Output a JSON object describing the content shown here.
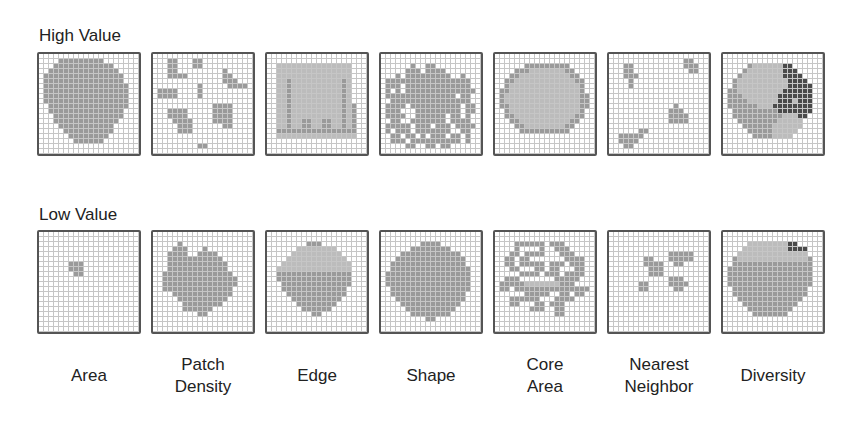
{
  "high_row": {
    "title": "High Value",
    "grids": [
      {
        "name": "area",
        "rows": [
          "00000000000000000000",
          "00001111111110000000",
          "00011111111111100000",
          "00111111111111110000",
          "01111111111111111000",
          "01111111111111111000",
          "01111111111111111100",
          "01111111111111111100",
          "01111111111111111100",
          "01111111111111111100",
          "00111111111111111100",
          "00111111111111111000",
          "00011111111111111000",
          "00011111111111110000",
          "00001111111111100000",
          "00000111111111100000",
          "00000011111111000000",
          "00000001111110000000",
          "00000000000000000000",
          "00000000000000000000"
        ]
      },
      {
        "name": "patch-density",
        "rows": [
          "00000000000000000000",
          "00011000110000000000",
          "00011000110000000000",
          "00011000000000100000",
          "00011110000000110000",
          "00000000000000111000",
          "00000000010000011110",
          "01111000010000000000",
          "01111000010000000000",
          "00000000000000000000",
          "00000000000011110000",
          "00011110000011110000",
          "00011110000011110000",
          "00001111000011110000",
          "00000111000000110000",
          "00000111000000000000",
          "00000000000000000000",
          "00000000000000000000",
          "00000000011000000000",
          "00000000000000000000"
        ]
      },
      {
        "name": "edge",
        "rows": [
          "00000000000000000000",
          "00000000000000000000",
          "00222222222222222000",
          "00222222222222222000",
          "00222222222222222000",
          "00221222222222212000",
          "00221222222222212000",
          "00221222222222212000",
          "00221222222222212000",
          "00221222222222212000",
          "00221222222222212100",
          "00221222222222212100",
          "00221222222222212100",
          "00221221122112212100",
          "00221221122112212100",
          "00111111111111111100",
          "00222222222222222200",
          "00000000000000000000",
          "00000000000000000000",
          "00000000000000000000"
        ]
      },
      {
        "name": "shape",
        "rows": [
          "00000000000000000000",
          "00000000000000000000",
          "00000010011000000000",
          "00000111011110000000",
          "00010111111111001000",
          "01111111111111111100",
          "01110111111111111100",
          "01010111111111111110",
          "01111111111111101100",
          "00111111111111111100",
          "01111011111111110110",
          "01110001111111110110",
          "01111001111110110100",
          "00110011111110111100",
          "01111101110111011110",
          "01011101111111001100",
          "00110110101110110100",
          "00111011111111110100",
          "00000110011011000000",
          "00000000000000000000"
        ]
      },
      {
        "name": "core-area",
        "rows": [
          "00000000000000000000",
          "00000000000000000000",
          "00000011111111100000",
          "00001112222222110000",
          "00011222222222211000",
          "00112222222222221100",
          "00122222222222222100",
          "01122222222222222100",
          "01222222222222222110",
          "01222222222222222110",
          "01122222222222222110",
          "00122222222222222100",
          "00112222222222221100",
          "00011222222222211000",
          "00001122222222110000",
          "00000111111111100000",
          "00000000000000000000",
          "00000000000000000000",
          "00000000000000000000",
          "00000000000000000000"
        ]
      },
      {
        "name": "nearest-neighbor",
        "rows": [
          "00000000000000000000",
          "00000000000000011000",
          "00011000000000011100",
          "00011000000000001100",
          "00011100000000000000",
          "00001000000000000000",
          "00001000000000000000",
          "00000000000000000000",
          "00000000000000000000",
          "00000000000000000000",
          "00000000000001000000",
          "00000000000011100000",
          "00000000000011110000",
          "00000000000011110000",
          "00000000000000000000",
          "00000011000000000000",
          "00111110000000000000",
          "00111100000000000000",
          "00011000000000000000",
          "00000000000000000000"
        ]
      },
      {
        "name": "diversity",
        "rows": [
          "00000000000000000000",
          "00000000000000000000",
          "00000122222233000000",
          "00001222222233300000",
          "00012222222233330000",
          "00122222222223333000",
          "00122222222223333300",
          "01122222222233333300",
          "01112222222333333300",
          "01111222222333233300",
          "01111112223333333300",
          "00111111111333333300",
          "00111111111122233000",
          "00011111111222220000",
          "00001111112222220000",
          "00000111112222200000",
          "00000011112222000000",
          "00000000000000000000",
          "00000000000000000000",
          "00000000000000000000"
        ]
      }
    ]
  },
  "low_row": {
    "title": "Low Value",
    "grids": [
      {
        "name": "area",
        "rows": [
          "00000000000000000000",
          "00000000000000000000",
          "00000000000000000000",
          "00000000000000000000",
          "00000000000000000000",
          "00000000000000000000",
          "00000011100000000000",
          "00000011100000000000",
          "00000001100000000000",
          "00000000000000000000",
          "00000000000000000000",
          "00000000000000000000",
          "00000000000000000000",
          "00000000000000000000",
          "00000000000000000000",
          "00000000000000000000",
          "00000000000000000000",
          "00000000000000000000",
          "00000000000000000000",
          "00000000000000000000"
        ]
      },
      {
        "name": "patch-density",
        "rows": [
          "00000000000000000000",
          "00000000000000000000",
          "00000100000000000000",
          "00001110001000000000",
          "00011110011110000000",
          "00011111111111000000",
          "00011111111111100000",
          "00011111111111100000",
          "00111111111111110000",
          "00111111111111111000",
          "00111111111111111000",
          "00111111111111110000",
          "00001111111111110000",
          "00000111111111100000",
          "00000011111111000000",
          "00000011111100000000",
          "00000000011000000000",
          "00000000000000000000",
          "00000000000000000000",
          "00000000000000000000"
        ]
      },
      {
        "name": "edge",
        "rows": [
          "00000000000000000000",
          "00000000000000000000",
          "00000000111000000000",
          "00000022222222000000",
          "00000222222222200000",
          "00002222222222220000",
          "00022222222222222000",
          "00222222222222222000",
          "00111111111111111000",
          "00111111111111111000",
          "00011111111111111000",
          "00011111111111110000",
          "00001111111111110000",
          "00000111111111100000",
          "00000011111111000000",
          "00000001111110000000",
          "00000000011000000000",
          "00000000000000000000",
          "00000000000000000000",
          "00000000000000000000"
        ]
      },
      {
        "name": "shape",
        "rows": [
          "00000000000000000000",
          "00000000000000000000",
          "00000000111100000000",
          "00000011111111000000",
          "00001111111111110000",
          "00011111111111111000",
          "00111111111111111000",
          "00111111111111111100",
          "01111111111111111100",
          "01111111111111111100",
          "01111111111111111100",
          "00111111111111111100",
          "00111111111111111000",
          "00011111111111111000",
          "00001111111111110000",
          "00000111111111100000",
          "00000011111111000000",
          "00000000011000000000",
          "00000000000000000000",
          "00000000000000000000"
        ]
      },
      {
        "name": "core-area",
        "rows": [
          "00000000000000000000",
          "00000000000000000000",
          "00001111110111000000",
          "00001000010011100000",
          "00011011110001110000",
          "00110110000000111100",
          "00110111110111011100",
          "00011000110110001100",
          "00000111101110111100",
          "00111000000011111000",
          "01111122222221110000",
          "01101111111111111110",
          "00000011111001101100",
          "00011111100011110000",
          "00011000110111000000",
          "00000001110011000000",
          "00000000000011000000",
          "00000000000000000000",
          "00000000000000000000",
          "00000000000000000000"
        ]
      },
      {
        "name": "nearest-neighbor",
        "rows": [
          "00000000000000000000",
          "00000000000000000000",
          "00000000000000000000",
          "00000000000000000000",
          "00000000000011111000",
          "00000001100011111000",
          "00000001111001100000",
          "00000000111000000000",
          "00000000111000000000",
          "00000000000011100000",
          "00000011000011110000",
          "00000011000001100000",
          "00000000000000000000",
          "00000000000000000000",
          "00000000000000000000",
          "00000000000000000000",
          "00000000000000000000",
          "00000000000000000000",
          "00000000000000000000",
          "00000000000000000000"
        ]
      },
      {
        "name": "diversity",
        "rows": [
          "00000000000000000000",
          "00000000000000000000",
          "00000222222223300000",
          "00002222222223333000",
          "00022222222222222000",
          "00122222222222222100",
          "00111111111111111100",
          "01111111111111111100",
          "01111111111111111100",
          "01111111111111111100",
          "01111111111111111100",
          "00111111111111111000",
          "00111111111111111000",
          "00011111111111110000",
          "00001111111111100000",
          "00000111111111000000",
          "00000011111110000000",
          "00000000000000000000",
          "00000000000000000000",
          "00000000000000000000"
        ]
      }
    ]
  },
  "metric_labels": [
    [
      "Area"
    ],
    [
      "Patch",
      "Density"
    ],
    [
      "Edge"
    ],
    [
      "Shape"
    ],
    [
      "Core",
      "Area"
    ],
    [
      "Nearest",
      "Neighbor"
    ],
    [
      "Diversity"
    ]
  ],
  "colors": {
    "patch": "#9a9a9a",
    "patch_light": "#bcbcbc",
    "patch_dark": "#4a4a4a",
    "gridline": "#c6c6c6",
    "border": "#555555"
  }
}
